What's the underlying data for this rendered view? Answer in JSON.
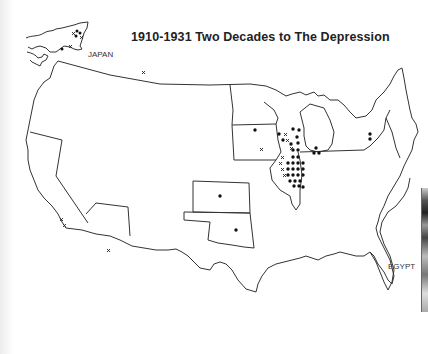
{
  "map": {
    "title": "1910-1931  Two Decades to The Depression",
    "labels": {
      "japan": "JAPAN",
      "egypt": "EGYPT"
    },
    "legend_symbols": {
      "dot": "filled-circle-marker",
      "cross": "x-marker"
    },
    "colors": {
      "background": "#ffffff",
      "outline": "#333333",
      "marker": "#111111"
    },
    "regions": [
      {
        "name": "Japan inset",
        "dots": 4,
        "crosses": 3
      },
      {
        "name": "Northwest border (Montana/Idaho)",
        "dots": 0,
        "crosses": 1
      },
      {
        "name": "California",
        "dots": 0,
        "crosses": 2
      },
      {
        "name": "Arizona",
        "dots": 0,
        "crosses": 1
      },
      {
        "name": "Kansas",
        "dots": 1,
        "crosses": 0
      },
      {
        "name": "Oklahoma",
        "dots": 1,
        "crosses": 0
      },
      {
        "name": "Minnesota",
        "dots": 1,
        "crosses": 0
      },
      {
        "name": "Iowa",
        "dots": 0,
        "crosses": 1
      },
      {
        "name": "Wisconsin",
        "dots": 9,
        "crosses": 3
      },
      {
        "name": "Illinois",
        "dots": 24,
        "crosses": 4
      },
      {
        "name": "Michigan / Indiana border",
        "dots": 3,
        "crosses": 0
      },
      {
        "name": "New York",
        "dots": 2,
        "crosses": 0
      },
      {
        "name": "Egypt inset",
        "dots": 0,
        "crosses": 0
      }
    ]
  }
}
